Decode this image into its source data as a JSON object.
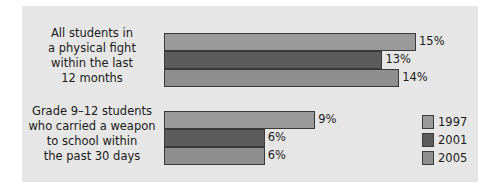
{
  "chart_data": {
    "type": "bar",
    "orientation": "horizontal",
    "title": "",
    "categories": [
      "All students in a physical fight within the last 12 months",
      "Grade 9–12 students who carried a weapon to school within the past 30 days"
    ],
    "category_lines": [
      [
        "All students in",
        "a physical fight",
        "within the last",
        "12 months"
      ],
      [
        "Grade 9–12 students",
        "who carried a weapon",
        "to school within",
        "the past 30 days"
      ]
    ],
    "series": [
      {
        "name": "1997",
        "color": "#9a9a9a",
        "values": [
          15,
          9
        ],
        "labels": [
          "15%",
          "9%"
        ]
      },
      {
        "name": "2001",
        "color": "#5c5c5c",
        "values": [
          13,
          6
        ],
        "labels": [
          "13%",
          "6%"
        ]
      },
      {
        "name": "2005",
        "color": "#8e8e8e",
        "values": [
          14,
          6
        ],
        "labels": [
          "14%",
          "6%"
        ]
      }
    ],
    "xlabel": "",
    "ylabel": "",
    "unit": "%",
    "grid": false,
    "legend_position": "right-bottom"
  }
}
